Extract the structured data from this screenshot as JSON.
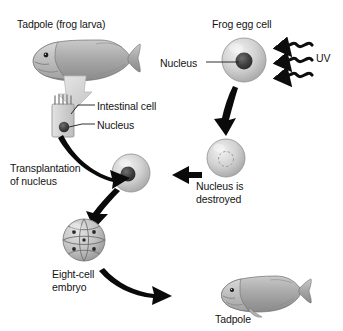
{
  "diagram": {
    "background_color": "#ffffff",
    "text_color": "#141414",
    "arrow_color": "#000000",
    "pale_arrow_color": "#d0d0d0",
    "cell_fill_light": "#e6e6e6",
    "cell_fill_mid": "#b4b4b4",
    "nucleus_color": "#3a3a3a",
    "organism_color": "#9c9c9c"
  },
  "labels": {
    "tadpole_larva": "Tadpole (frog larva)",
    "frog_egg_cell": "Frog egg cell",
    "egg_nucleus": "Nucleus",
    "uv": "UV",
    "intestinal_cell": "Intestinal cell",
    "cell_nucleus": "Nucleus",
    "transplantation": "Transplantation\nof nucleus",
    "nucleus_destroyed": "Nucleus is\ndestroyed",
    "eight_cell_embryo": "Eight-cell\nembryo",
    "tadpole_end": "Tadpole"
  },
  "icons": {
    "tadpole_donor": "tadpole-icon",
    "tadpole_clone": "tadpole-icon",
    "frog_egg": "egg-cell-icon",
    "enucleated_egg": "enucleated-egg-cell-icon",
    "recipient_egg": "egg-cell-with-transplanted-nucleus-icon",
    "intestinal_cell": "intestinal-cell-icon",
    "embryo": "eight-cell-embryo-icon",
    "uv_rays": "uv-wave-arrow-icon",
    "pale_arrow": "pale-block-arrow-icon",
    "flow_arrows": "curved-block-arrow-icon",
    "leader_lines": "leader-line-icon"
  }
}
